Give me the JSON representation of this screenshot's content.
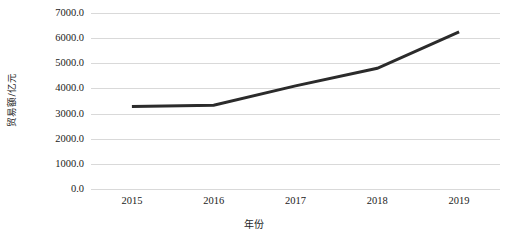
{
  "chart_data": {
    "type": "line",
    "title": "",
    "xlabel": "年份",
    "ylabel": "贸易额/亿元",
    "categories": [
      "2015",
      "2016",
      "2017",
      "2018",
      "2019"
    ],
    "x": [
      2015,
      2016,
      2017,
      2018,
      2019
    ],
    "values": [
      3280,
      3330,
      4100,
      4800,
      6250
    ],
    "series": [
      {
        "name": "贸易额",
        "values": [
          3280,
          3330,
          4100,
          4800,
          6250
        ]
      }
    ],
    "ylim": [
      0,
      7000
    ],
    "y_ticks": [
      0,
      1000,
      2000,
      3000,
      4000,
      5000,
      6000,
      7000
    ],
    "y_tick_labels": [
      "0.0",
      "1000.0",
      "2000.0",
      "3000.0",
      "4000.0",
      "5000.0",
      "6000.0",
      "7000.0"
    ],
    "x_tick_labels": [
      "2015",
      "2016",
      "2017",
      "2018",
      "2019"
    ],
    "grid": "horizontal",
    "legend": "none",
    "line_color": "#2b2b2b",
    "grid_color": "#d9d9d9",
    "background_color": "#ffffff",
    "markers": false,
    "line_width": 3
  }
}
